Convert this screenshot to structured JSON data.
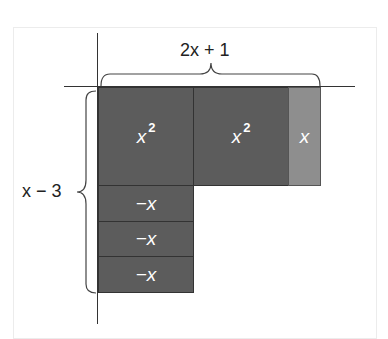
{
  "diagram": {
    "top_label": "2x + 1",
    "side_label": "x − 3",
    "tiles": [
      {
        "kind": "x-squared",
        "label": "x",
        "exponent": "2",
        "color": "#5c5c5c"
      },
      {
        "kind": "x-squared",
        "label": "x",
        "exponent": "2",
        "color": "#5c5c5c"
      },
      {
        "kind": "x",
        "label": "x",
        "color": "#8e8e8e"
      },
      {
        "kind": "negative-x",
        "label": "−x",
        "color": "#5c5c5c"
      },
      {
        "kind": "negative-x",
        "label": "−x",
        "color": "#5c5c5c"
      },
      {
        "kind": "negative-x",
        "label": "−x",
        "color": "#5c5c5c"
      }
    ]
  }
}
